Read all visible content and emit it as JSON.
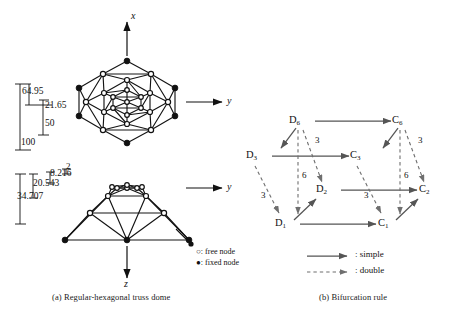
{
  "figure": {
    "captions": {
      "a": "(a) Regular-hexagonal truss dome",
      "b": "(b) Bifurcation rule"
    }
  },
  "plan_view": {
    "axes": [
      {
        "name": "x",
        "label": "x",
        "direction": "up"
      },
      {
        "name": "y",
        "label": "y",
        "direction": "right"
      }
    ],
    "dimensions": [
      {
        "id": "d1",
        "value": "64.95"
      },
      {
        "id": "d2",
        "value": "21.65"
      },
      {
        "id": "d3",
        "value": "50"
      },
      {
        "id": "d4",
        "value": "100"
      }
    ]
  },
  "elevation_view": {
    "axes": [
      {
        "name": "y",
        "label": "y",
        "direction": "right"
      },
      {
        "name": "z",
        "label": "z",
        "direction": "down"
      }
    ],
    "dimensions": [
      {
        "id": "e1",
        "value": "2"
      },
      {
        "id": "e2",
        "value": "8.216"
      },
      {
        "id": "e3",
        "value": "20.543"
      },
      {
        "id": "e4",
        "value": "34.707"
      }
    ]
  },
  "node_legend": {
    "free": "○: free node",
    "fixed": "●: fixed node"
  },
  "bifurcation": {
    "nodes": [
      {
        "id": "D6",
        "base": "D",
        "sub": "6",
        "x": 298,
        "y": 124
      },
      {
        "id": "C6",
        "base": "C",
        "sub": "6",
        "x": 400,
        "y": 124
      },
      {
        "id": "D3",
        "base": "D",
        "sub": "3",
        "x": 255,
        "y": 159
      },
      {
        "id": "C3",
        "base": "C",
        "sub": "3",
        "x": 358,
        "y": 159
      },
      {
        "id": "D2",
        "base": "D",
        "sub": "2",
        "x": 324,
        "y": 193
      },
      {
        "id": "C2",
        "base": "C",
        "sub": "2",
        "x": 426,
        "y": 193
      },
      {
        "id": "D1",
        "base": "D",
        "sub": "1",
        "x": 283,
        "y": 227
      },
      {
        "id": "C1",
        "base": "C",
        "sub": "1",
        "x": 385,
        "y": 227
      }
    ],
    "multiplicity_labels": [
      {
        "id": "m1",
        "value": "3",
        "x": 318,
        "y": 141
      },
      {
        "id": "m2",
        "value": "3",
        "x": 420,
        "y": 141
      },
      {
        "id": "m3",
        "value": "6",
        "x": 303,
        "y": 176
      },
      {
        "id": "m4",
        "value": "6",
        "x": 405,
        "y": 176
      },
      {
        "id": "m5",
        "value": "3",
        "x": 265,
        "y": 196
      },
      {
        "id": "m6",
        "value": "3",
        "x": 367,
        "y": 196
      }
    ],
    "edge_legend": {
      "simple": ": simple",
      "double": ": double"
    }
  },
  "colors": {
    "stroke": "#1a1a1a",
    "member": "#111111",
    "arrow_gray": "#555555",
    "dash_gray": "#7a7a7a",
    "background": "#ffffff"
  }
}
